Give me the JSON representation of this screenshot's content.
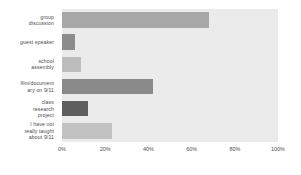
{
  "chart_data": {
    "type": "bar",
    "orientation": "horizontal",
    "title": "",
    "xlabel": "",
    "ylabel": "",
    "categories": [
      "group discussion",
      "guest speaker",
      "school assembly",
      "film/documentary on 9/11",
      "class research project",
      "I have not really taught about 9/11"
    ],
    "category_lines": [
      [
        "group",
        "discussion"
      ],
      [
        "guest speaker"
      ],
      [
        "school",
        "assembly"
      ],
      [
        "film/document",
        "ary on 9/11"
      ],
      [
        "class",
        "research",
        "project"
      ],
      [
        "I have not",
        "really taught",
        "about 9/11"
      ]
    ],
    "values": [
      68,
      6,
      9,
      42,
      12,
      23
    ],
    "bar_colors": [
      "#a8a8a8",
      "#8c8c8c",
      "#bdbdbd",
      "#8a8a8a",
      "#5e5e5e",
      "#c2c2c2"
    ],
    "xlim": [
      0,
      100
    ],
    "xticks": [
      0,
      20,
      40,
      60,
      80,
      100
    ],
    "xtick_labels": [
      "0%",
      "20%",
      "40%",
      "60%",
      "80%",
      "100%"
    ],
    "grid": false,
    "legend": "none",
    "plot_background": "#ebebeb",
    "figure_background": "#ffffff",
    "tick_label_color": "#4d4d4d"
  }
}
